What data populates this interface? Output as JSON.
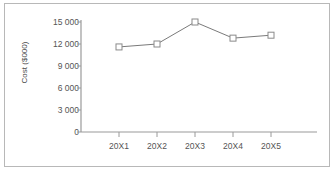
{
  "chart_data": {
    "type": "line",
    "title": "",
    "subtitle": "",
    "xlabel": "",
    "ylabel": "Cost ($000)",
    "categories": [
      "20X1",
      "20X2",
      "20X3",
      "20X4",
      "20X5"
    ],
    "values": [
      11600,
      12000,
      15000,
      12800,
      13200
    ],
    "series": [
      {
        "name": "Cost",
        "values": [
          11600,
          12000,
          15000,
          12800,
          13200
        ]
      }
    ],
    "ylim": [
      0,
      15000
    ],
    "ytick_values": [
      0,
      3000,
      6000,
      9000,
      12000,
      15000
    ],
    "ytick_labels": [
      "0",
      "3 000",
      "6 000",
      "9 000",
      "12 000",
      "15 000"
    ],
    "grid": false,
    "legend": false,
    "legend_position": "none",
    "marker": "open-square",
    "line_color": "#7a7a7a",
    "marker_fill_color": "#ffffff",
    "marker_edge_color": "#8a8a8a",
    "axis_color": "#9a9a9a",
    "text_color": "#555555",
    "background_color": "#ffffff",
    "border_color": "#b8b8b8"
  }
}
